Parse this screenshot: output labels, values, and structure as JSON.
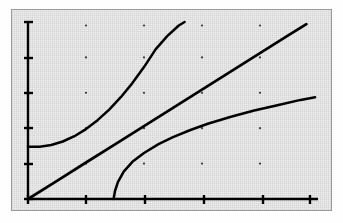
{
  "figure": {
    "title": "",
    "background_color": "#ededed",
    "frame_color": "#9a9a9a",
    "ink_color": "#000000",
    "page_color": "#ffffff"
  },
  "chart_data": {
    "type": "line",
    "title": "",
    "subtitle": "",
    "xlabel": "",
    "ylabel": "",
    "xlim": [
      0,
      10
    ],
    "ylim": [
      0,
      10
    ],
    "grid": "dots",
    "grid_x": [
      2,
      4,
      6,
      8
    ],
    "grid_y": [
      2,
      4,
      6,
      8,
      9.8
    ],
    "legend": "none",
    "x_ticks": [
      0,
      2,
      4,
      6,
      8,
      10
    ],
    "x_tick_labels": [
      "",
      "",
      "",
      "",
      "",
      ""
    ],
    "y_ticks": [
      0,
      2,
      4,
      6,
      8,
      10
    ],
    "y_tick_labels": [
      "",
      "",
      "",
      "",
      "",
      ""
    ],
    "annotations": [],
    "series": [
      {
        "name": "exponential-curve",
        "style": "solid",
        "description": "convex increasing curve, flat start near y=3, rises steeply off top of axes",
        "x": [
          0.0,
          0.4,
          0.8,
          1.2,
          1.6,
          2.0,
          2.4,
          2.8,
          3.2,
          3.6,
          4.0,
          4.4,
          4.8,
          5.2,
          5.4
        ],
        "y": [
          2.95,
          2.95,
          3.05,
          3.25,
          3.55,
          3.95,
          4.45,
          5.05,
          5.75,
          6.55,
          7.45,
          8.45,
          9.2,
          9.8,
          10.0
        ]
      },
      {
        "name": "linear-line",
        "style": "solid",
        "description": "straight line through the origin with positive slope",
        "x": [
          0.0,
          1.0,
          2.0,
          3.0,
          4.0,
          5.0,
          6.0,
          7.0,
          8.0,
          9.0,
          9.6
        ],
        "y": [
          0.0,
          1.03,
          2.06,
          3.09,
          4.12,
          5.15,
          6.18,
          7.21,
          8.24,
          9.27,
          9.88
        ]
      },
      {
        "name": "logarithmic-curve",
        "style": "solid",
        "description": "concave increasing curve rising from the x-axis near x=3, flattening to the right",
        "x": [
          2.95,
          3.0,
          3.1,
          3.3,
          3.6,
          4.0,
          4.5,
          5.0,
          5.6,
          6.2,
          7.0,
          7.8,
          8.6,
          9.4,
          9.9
        ],
        "y": [
          0.0,
          0.45,
          0.95,
          1.55,
          2.1,
          2.6,
          3.1,
          3.5,
          3.9,
          4.25,
          4.65,
          5.0,
          5.3,
          5.6,
          5.75
        ]
      }
    ]
  }
}
